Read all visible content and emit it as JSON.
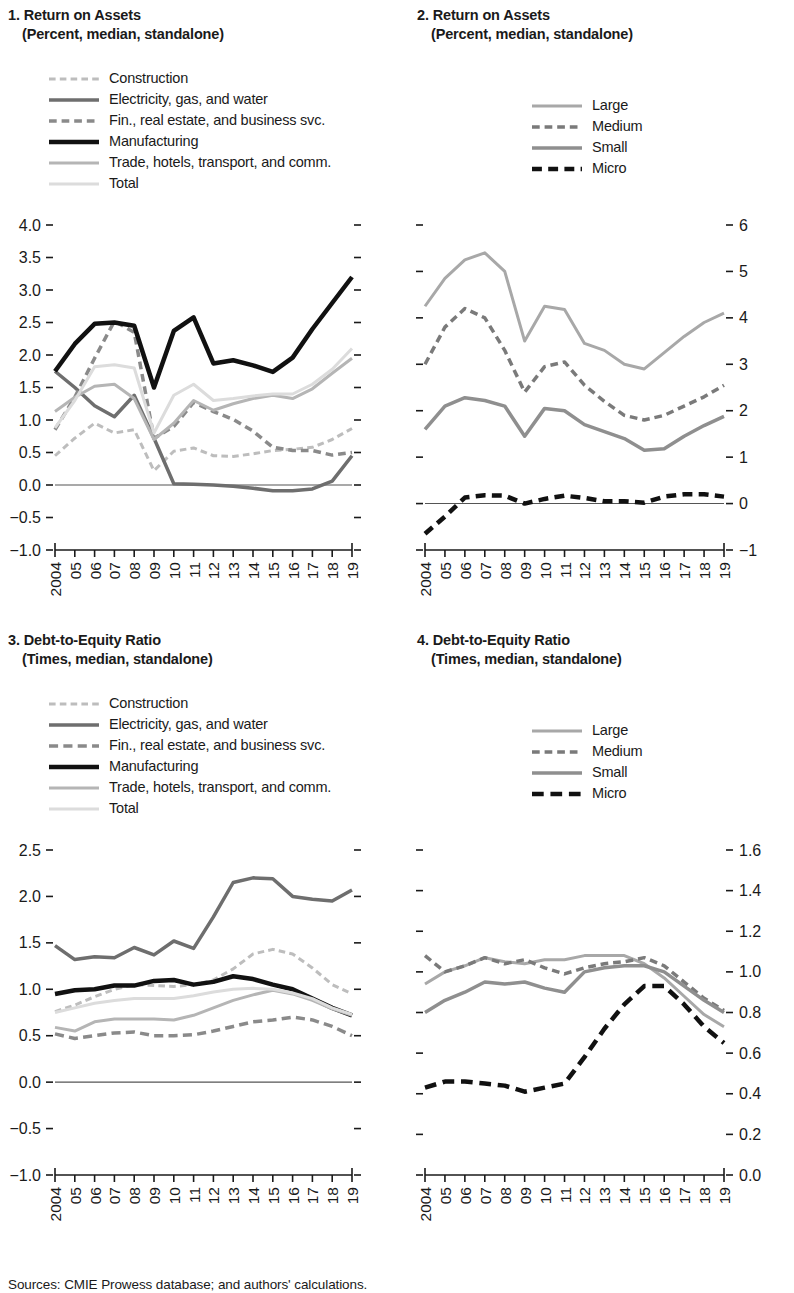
{
  "figure": {
    "sources": "Sources: CMIE Prowess database; and authors' calculations."
  },
  "colors": {
    "construction": "#bdbdbd",
    "electricity": "#6e6e6e",
    "finance": "#8a8a8a",
    "manufacturing": "#111111",
    "trade": "#b5b5b5",
    "total": "#dcdcdc",
    "large": "#a8a8a8",
    "medium": "#7a7a7a",
    "small": "#8f8f8f",
    "micro": "#111111",
    "axis": "#1a1a1a",
    "zeroline": "#555555"
  },
  "panels": [
    {
      "id": "panel-1",
      "number": "1.",
      "title": "Return on Assets",
      "subtitle": "(Percent, median, standalone)",
      "legend": [
        {
          "label": "Construction",
          "key": "construction",
          "style": "dotdash",
          "width": 3
        },
        {
          "label": "Electricity, gas, and water",
          "key": "electricity",
          "style": "solid",
          "width": 3.5
        },
        {
          "label": "Fin., real estate, and business svc.",
          "key": "finance",
          "style": "dotdash",
          "width": 3.5
        },
        {
          "label": "Manufacturing",
          "key": "manufacturing",
          "style": "solid",
          "width": 4.5
        },
        {
          "label": "Trade, hotels, transport, and comm.",
          "key": "trade",
          "style": "solid",
          "width": 3
        },
        {
          "label": "Total",
          "key": "total",
          "style": "solid",
          "width": 3
        }
      ]
    },
    {
      "id": "panel-2",
      "number": "2.",
      "title": "Return on Assets",
      "subtitle": "(Percent, median, standalone)",
      "legend": [
        {
          "label": "Large",
          "key": "large",
          "style": "solid",
          "width": 3
        },
        {
          "label": "Medium",
          "key": "medium",
          "style": "dotdash",
          "width": 3.5
        },
        {
          "label": "Small",
          "key": "small",
          "style": "solid",
          "width": 3.5
        },
        {
          "label": "Micro",
          "key": "micro",
          "style": "dotdash",
          "width": 4.5
        }
      ]
    },
    {
      "id": "panel-3",
      "number": "3.",
      "title": "Debt-to-Equity Ratio",
      "subtitle": "(Times, median, standalone)",
      "legend": [
        {
          "label": "Construction",
          "key": "construction",
          "style": "dotdash",
          "width": 3
        },
        {
          "label": "Electricity, gas, and water",
          "key": "electricity",
          "style": "solid",
          "width": 3.5
        },
        {
          "label": "Fin., real estate, and business svc.",
          "key": "finance",
          "style": "dash",
          "width": 3.5
        },
        {
          "label": "Manufacturing",
          "key": "manufacturing",
          "style": "solid",
          "width": 4.5
        },
        {
          "label": "Trade, hotels, transport, and comm.",
          "key": "trade",
          "style": "solid",
          "width": 3
        },
        {
          "label": "Total",
          "key": "total",
          "style": "solid",
          "width": 3
        }
      ]
    },
    {
      "id": "panel-4",
      "number": "4.",
      "title": "Debt-to-Equity Ratio",
      "subtitle": "(Times, median, standalone)",
      "legend": [
        {
          "label": "Large",
          "key": "large",
          "style": "solid",
          "width": 3
        },
        {
          "label": "Medium",
          "key": "medium",
          "style": "dotdash",
          "width": 3.5
        },
        {
          "label": "Small",
          "key": "small",
          "style": "solid",
          "width": 3.5
        },
        {
          "label": "Micro",
          "key": "micro",
          "style": "dash",
          "width": 4.5
        }
      ]
    }
  ],
  "chart_data": [
    {
      "id": "panel-1",
      "type": "line",
      "title": "1. Return on Assets",
      "subtitle": "(Percent, median, standalone)",
      "xlabel": "",
      "ylabel": "Percent, median, standalone",
      "x": [
        2004,
        2005,
        2006,
        2007,
        2008,
        2009,
        2010,
        2011,
        2012,
        2013,
        2014,
        2015,
        2016,
        2017,
        2018,
        2019
      ],
      "xticklabels": [
        "2004",
        "05",
        "06",
        "07",
        "08",
        "09",
        "10",
        "11",
        "12",
        "13",
        "14",
        "15",
        "16",
        "17",
        "18",
        "19"
      ],
      "ylim": [
        -1.0,
        4.0
      ],
      "yticks": [
        -1.0,
        -0.5,
        0.0,
        0.5,
        1.0,
        1.5,
        2.0,
        2.5,
        3.0,
        3.5,
        4.0
      ],
      "yticklabels": [
        "−1.0",
        "−0.5",
        "0.0",
        "0.5",
        "1.0",
        "1.5",
        "2.0",
        "2.5",
        "3.0",
        "3.5",
        "4.0"
      ],
      "axis_side": "left",
      "grid": false,
      "legend_position": "top",
      "zero_line": 0.0,
      "series": [
        {
          "name": "Construction",
          "key": "construction",
          "style": "dotdash",
          "values": [
            0.45,
            0.72,
            0.95,
            0.8,
            0.85,
            0.22,
            0.52,
            0.57,
            0.45,
            0.44,
            0.48,
            0.53,
            0.55,
            0.58,
            0.7,
            0.87
          ]
        },
        {
          "name": "Electricity, gas, and water",
          "key": "electricity",
          "style": "solid",
          "values": [
            1.75,
            1.5,
            1.22,
            1.05,
            1.38,
            0.72,
            0.02,
            0.01,
            0.0,
            -0.02,
            -0.05,
            -0.09,
            -0.09,
            -0.06,
            0.06,
            0.45
          ]
        },
        {
          "name": "Fin., real estate, and business svc.",
          "key": "finance",
          "style": "dotdash",
          "values": [
            0.85,
            1.35,
            1.95,
            2.52,
            2.35,
            0.72,
            0.9,
            1.27,
            1.13,
            1.01,
            0.83,
            0.58,
            0.53,
            0.53,
            0.46,
            0.5
          ]
        },
        {
          "name": "Manufacturing",
          "key": "manufacturing",
          "style": "solid",
          "values": [
            1.75,
            2.17,
            2.48,
            2.5,
            2.45,
            1.5,
            2.37,
            2.58,
            1.87,
            1.92,
            1.84,
            1.74,
            1.96,
            2.4,
            2.8,
            3.2
          ]
        },
        {
          "name": "Trade, hotels, transport, and comm.",
          "key": "trade",
          "style": "solid",
          "values": [
            1.13,
            1.35,
            1.52,
            1.55,
            1.33,
            0.7,
            0.95,
            1.3,
            1.15,
            1.25,
            1.33,
            1.38,
            1.33,
            1.48,
            1.72,
            1.95
          ]
        },
        {
          "name": "Total",
          "key": "total",
          "style": "solid",
          "values": [
            0.88,
            1.3,
            1.82,
            1.85,
            1.8,
            0.8,
            1.38,
            1.55,
            1.3,
            1.33,
            1.37,
            1.4,
            1.4,
            1.55,
            1.78,
            2.1
          ]
        }
      ]
    },
    {
      "id": "panel-2",
      "type": "line",
      "title": "2. Return on Assets",
      "subtitle": "(Percent, median, standalone)",
      "xlabel": "",
      "ylabel": "Percent, median, standalone",
      "x": [
        2004,
        2005,
        2006,
        2007,
        2008,
        2009,
        2010,
        2011,
        2012,
        2013,
        2014,
        2015,
        2016,
        2017,
        2018,
        2019
      ],
      "xticklabels": [
        "2004",
        "05",
        "06",
        "07",
        "08",
        "09",
        "10",
        "11",
        "12",
        "13",
        "14",
        "15",
        "16",
        "17",
        "18",
        "19"
      ],
      "ylim": [
        -1,
        6
      ],
      "yticks": [
        -1,
        0,
        1,
        2,
        3,
        4,
        5,
        6
      ],
      "yticklabels": [
        "−1",
        "0",
        "1",
        "2",
        "3",
        "4",
        "5",
        "6"
      ],
      "axis_side": "right",
      "grid": false,
      "legend_position": "top",
      "zero_line": 0,
      "series": [
        {
          "name": "Large",
          "key": "large",
          "style": "solid",
          "values": [
            4.25,
            4.85,
            5.25,
            5.4,
            5.0,
            3.5,
            4.25,
            4.18,
            3.45,
            3.3,
            3.0,
            2.9,
            3.25,
            3.6,
            3.9,
            4.1
          ]
        },
        {
          "name": "Medium",
          "key": "medium",
          "style": "dotdash",
          "values": [
            3.0,
            3.8,
            4.2,
            4.0,
            3.3,
            2.4,
            2.95,
            3.05,
            2.55,
            2.2,
            1.9,
            1.8,
            1.9,
            2.1,
            2.3,
            2.55
          ]
        },
        {
          "name": "Small",
          "key": "small",
          "style": "solid",
          "values": [
            1.6,
            2.1,
            2.28,
            2.22,
            2.1,
            1.45,
            2.05,
            2.0,
            1.7,
            1.55,
            1.4,
            1.15,
            1.18,
            1.45,
            1.68,
            1.88
          ]
        },
        {
          "name": "Micro",
          "key": "micro",
          "style": "dotdash",
          "values": [
            -0.65,
            -0.28,
            0.13,
            0.18,
            0.17,
            0.0,
            0.1,
            0.17,
            0.12,
            0.05,
            0.05,
            0.02,
            0.15,
            0.2,
            0.2,
            0.15
          ]
        }
      ]
    },
    {
      "id": "panel-3",
      "type": "line",
      "title": "3. Debt-to-Equity Ratio",
      "subtitle": "(Times, median, standalone)",
      "xlabel": "",
      "ylabel": "Times, median, standalone",
      "x": [
        2004,
        2005,
        2006,
        2007,
        2008,
        2009,
        2010,
        2011,
        2012,
        2013,
        2014,
        2015,
        2016,
        2017,
        2018,
        2019
      ],
      "xticklabels": [
        "2004",
        "05",
        "06",
        "07",
        "08",
        "09",
        "10",
        "11",
        "12",
        "13",
        "14",
        "15",
        "16",
        "17",
        "18",
        "19"
      ],
      "ylim": [
        -1.0,
        2.5
      ],
      "yticks": [
        -1.0,
        -0.5,
        0.0,
        0.5,
        1.0,
        1.5,
        2.0,
        2.5
      ],
      "yticklabels": [
        "−1.0",
        "−0.5",
        "0.0",
        "0.5",
        "1.0",
        "1.5",
        "2.0",
        "2.5"
      ],
      "axis_side": "left",
      "grid": false,
      "legend_position": "top",
      "zero_line": 0.0,
      "series": [
        {
          "name": "Construction",
          "key": "construction",
          "style": "dotdash",
          "values": [
            0.76,
            0.83,
            0.92,
            1.0,
            1.05,
            1.04,
            1.03,
            1.05,
            1.1,
            1.22,
            1.38,
            1.43,
            1.38,
            1.23,
            1.05,
            0.95
          ]
        },
        {
          "name": "Electricity, gas, and water",
          "key": "electricity",
          "style": "solid",
          "values": [
            1.47,
            1.32,
            1.35,
            1.34,
            1.45,
            1.37,
            1.52,
            1.44,
            1.78,
            2.15,
            2.2,
            2.19,
            2.0,
            1.97,
            1.95,
            2.07
          ]
        },
        {
          "name": "Fin., real estate, and business svc.",
          "key": "finance",
          "style": "dash",
          "values": [
            0.52,
            0.47,
            0.5,
            0.53,
            0.54,
            0.5,
            0.5,
            0.51,
            0.55,
            0.6,
            0.65,
            0.67,
            0.7,
            0.67,
            0.6,
            0.5
          ]
        },
        {
          "name": "Manufacturing",
          "key": "manufacturing",
          "style": "solid",
          "values": [
            0.95,
            0.99,
            1.0,
            1.04,
            1.04,
            1.09,
            1.1,
            1.05,
            1.08,
            1.14,
            1.11,
            1.05,
            1.0,
            0.9,
            0.8,
            0.72
          ]
        },
        {
          "name": "Trade, hotels, transport, and comm.",
          "key": "trade",
          "style": "solid",
          "values": [
            0.59,
            0.55,
            0.65,
            0.68,
            0.68,
            0.68,
            0.67,
            0.72,
            0.8,
            0.88,
            0.94,
            0.99,
            0.95,
            0.88,
            0.79,
            0.72
          ]
        },
        {
          "name": "Total",
          "key": "total",
          "style": "solid",
          "values": [
            0.75,
            0.8,
            0.85,
            0.88,
            0.9,
            0.9,
            0.9,
            0.93,
            0.97,
            1.0,
            1.01,
            1.0,
            0.96,
            0.9,
            0.8,
            0.73
          ]
        }
      ]
    },
    {
      "id": "panel-4",
      "type": "line",
      "title": "4. Debt-to-Equity Ratio",
      "subtitle": "(Times, median, standalone)",
      "xlabel": "",
      "ylabel": "Times, median, standalone",
      "x": [
        2004,
        2005,
        2006,
        2007,
        2008,
        2009,
        2010,
        2011,
        2012,
        2013,
        2014,
        2015,
        2016,
        2017,
        2018,
        2019
      ],
      "xticklabels": [
        "2004",
        "05",
        "06",
        "07",
        "08",
        "09",
        "10",
        "11",
        "12",
        "13",
        "14",
        "15",
        "16",
        "17",
        "18",
        "19"
      ],
      "ylim": [
        0.0,
        1.6
      ],
      "yticks": [
        0.0,
        0.2,
        0.4,
        0.6,
        0.8,
        1.0,
        1.2,
        1.4,
        1.6
      ],
      "yticklabels": [
        "0.0",
        "0.2",
        "0.4",
        "0.6",
        "0.8",
        "1.0",
        "1.2",
        "1.4",
        "1.6"
      ],
      "axis_side": "right",
      "grid": false,
      "legend_position": "top",
      "zero_line": null,
      "series": [
        {
          "name": "Large",
          "key": "large",
          "style": "solid",
          "values": [
            0.94,
            1.0,
            1.03,
            1.07,
            1.05,
            1.04,
            1.06,
            1.06,
            1.08,
            1.08,
            1.08,
            1.04,
            0.97,
            0.88,
            0.79,
            0.73
          ]
        },
        {
          "name": "Medium",
          "key": "medium",
          "style": "dotdash",
          "values": [
            1.08,
            1.0,
            1.03,
            1.07,
            1.04,
            1.06,
            1.02,
            0.99,
            1.02,
            1.04,
            1.05,
            1.07,
            1.03,
            0.95,
            0.87,
            0.81
          ]
        },
        {
          "name": "Small",
          "key": "small",
          "style": "solid",
          "values": [
            0.8,
            0.86,
            0.9,
            0.95,
            0.94,
            0.95,
            0.92,
            0.9,
            1.0,
            1.02,
            1.03,
            1.03,
            1.0,
            0.93,
            0.86,
            0.8
          ]
        },
        {
          "name": "Micro",
          "key": "micro",
          "style": "dash",
          "values": [
            0.43,
            0.46,
            0.46,
            0.45,
            0.44,
            0.41,
            0.43,
            0.45,
            0.58,
            0.72,
            0.84,
            0.93,
            0.93,
            0.84,
            0.73,
            0.65
          ]
        }
      ]
    }
  ]
}
